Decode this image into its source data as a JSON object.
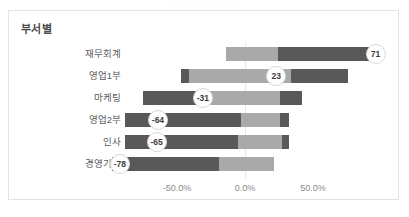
{
  "page": {
    "faint_title": "부서별 기여도 분석"
  },
  "card": {
    "title": "부서별"
  },
  "chart_data": {
    "type": "bar",
    "orientation": "horizontal",
    "title": "부서별",
    "xlabel": "",
    "ylabel": "",
    "xlim": [
      -100,
      100
    ],
    "grid": true,
    "legend": null,
    "axis_ticks": [
      "-50.0%",
      "0.0%",
      "50.0%"
    ],
    "axis_tick_values": [
      -50,
      0,
      50
    ],
    "categories": [
      "재무회계",
      "영업1부",
      "마케팅",
      "영업2부",
      "인사",
      "경영기획"
    ],
    "values": [
      71,
      23,
      -31,
      -64,
      -65,
      -78
    ],
    "value_labels": [
      "71",
      "23",
      "-31",
      "-64",
      "-65",
      "-78"
    ],
    "colors": {
      "light": "#a9a9a9",
      "dark": "#595959",
      "gridline": "#e6e6e6"
    },
    "rows": [
      {
        "category": "재무회계",
        "value": 71,
        "label": "71",
        "bar_start_pct": -14,
        "segments": [
          {
            "shade": "light",
            "from_pct": -14,
            "to_pct": 24
          },
          {
            "shade": "dark",
            "from_pct": 24,
            "to_pct": 100
          }
        ],
        "label_pct": 96
      },
      {
        "category": "영업1부",
        "value": 23,
        "label": "23",
        "bar_start_pct": -47,
        "segments": [
          {
            "shade": "dark",
            "from_pct": -47,
            "to_pct": -41
          },
          {
            "shade": "light",
            "from_pct": -41,
            "to_pct": 34
          },
          {
            "shade": "dark",
            "from_pct": 34,
            "to_pct": 76
          }
        ],
        "label_pct": 23
      },
      {
        "category": "마케팅",
        "value": -31,
        "label": "-31",
        "bar_start_pct": -75,
        "segments": [
          {
            "shade": "dark",
            "from_pct": -75,
            "to_pct": -31
          },
          {
            "shade": "light",
            "from_pct": -31,
            "to_pct": 26
          },
          {
            "shade": "dark",
            "from_pct": 26,
            "to_pct": 42
          }
        ],
        "label_pct": -31
      },
      {
        "category": "영업2부",
        "value": -64,
        "label": "-64",
        "bar_start_pct": -88,
        "segments": [
          {
            "shade": "dark",
            "from_pct": -88,
            "to_pct": -3
          },
          {
            "shade": "light",
            "from_pct": -3,
            "to_pct": 26
          },
          {
            "shade": "dark",
            "from_pct": 26,
            "to_pct": 32
          }
        ],
        "label_pct": -64
      },
      {
        "category": "인사",
        "value": -65,
        "label": "-65",
        "bar_start_pct": -88,
        "segments": [
          {
            "shade": "dark",
            "from_pct": -88,
            "to_pct": -5
          },
          {
            "shade": "light",
            "from_pct": -5,
            "to_pct": 27
          },
          {
            "shade": "dark",
            "from_pct": 27,
            "to_pct": 32
          }
        ],
        "label_pct": -65
      },
      {
        "category": "경영기획",
        "value": -78,
        "label": "-78",
        "bar_start_pct": -98,
        "segments": [
          {
            "shade": "dark",
            "from_pct": -98,
            "to_pct": -19
          },
          {
            "shade": "light",
            "from_pct": -19,
            "to_pct": 21
          }
        ],
        "label_pct": -92
      }
    ]
  }
}
